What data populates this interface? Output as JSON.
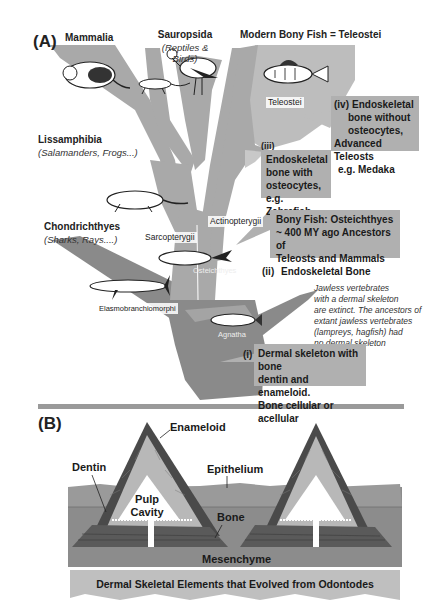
{
  "panel_a": {
    "label": "(A)",
    "clades": {
      "mammalia": "Mammalia",
      "sauropsida": "Sauropsida",
      "sauropsida_sub": "(Reptiles & Birds)",
      "teleostei_header": "Modern Bony Fish = Teleostei",
      "lissamphibia": "Lissamphibia",
      "lissamphibia_sub": "(Salamanders, Frogs...)",
      "chondrichthyes": "Chondrichthyes",
      "chondrichthyes_sub": "(Sharks, Rays....)"
    },
    "branch_tags": {
      "teleostei": "Teleostei",
      "actinopterygii": "Actinopterygii",
      "sarcopterygii": "Sarcopterygii",
      "osteichthyes": "Osteichthyes",
      "elasmobranchiomorphi": "Elasmobranchiomorphi",
      "agnatha": "Agnatha"
    },
    "callouts": {
      "iv": {
        "numeral": "(iv)",
        "lines": [
          "Endoskeletal",
          "bone without",
          "osteocytes,",
          "Advanced Teleosts",
          "e.g. Medaka"
        ]
      },
      "iii": {
        "numeral": "(iii)",
        "lines": [
          "Endoskeletal",
          "bone with",
          "osteocytes,",
          "e.g. Zebrafish"
        ]
      },
      "ii": {
        "line1": "Bony Fish: Osteichthyes",
        "line2": "~ 400 MY ago Ancestors of",
        "line3": "Teleosts and Mammals",
        "numeral": "(ii)",
        "line4": "Endoskeletal Bone"
      },
      "i": {
        "numeral": "(i)",
        "lines": [
          "Dermal skeleton with bone",
          "dentin and enameloid.",
          "Bone cellular or acellular"
        ]
      }
    },
    "jawless_note": [
      "Jawless vertebrates",
      "with a dermal skeleton",
      "are extinct. The ancestors of",
      "extant jawless vertebrates",
      "(lampreys, hagfish)  had",
      "no dermal skeleton"
    ]
  },
  "panel_b": {
    "label": "(B)",
    "labels": {
      "enameloid": "Enameloid",
      "dentin": "Dentin",
      "epithelium": "Epithelium",
      "pulp": "Pulp",
      "cavity": "Cavity",
      "bone": "Bone",
      "mesenchyme": "Mesenchyme"
    },
    "banner": "Dermal Skeletal Elements that Evolved from Odontodes"
  },
  "colors": {
    "tree_light": "#a9a9a9",
    "tree_dark": "#8a8a8a",
    "teleost_fan": "#bdbdbd",
    "callout_bg": "#b0b0b0",
    "divider": "#9a9a9a",
    "enameloid": "#4a4a4a",
    "dentin": "#b8b8b8",
    "mesenchyme": "#8c8c8c",
    "epithelium": "#9a9a9a",
    "banner": "#bfbfbf"
  }
}
